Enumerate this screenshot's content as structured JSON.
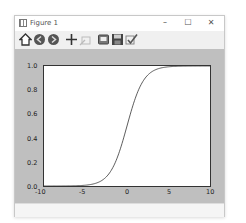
{
  "window": {
    "title": "Figure 1",
    "controls": {
      "minimize": "–",
      "maximize": "☐",
      "close": "✕"
    }
  },
  "toolbar": {
    "buttons": [
      {
        "name": "home",
        "icon": "home-icon"
      },
      {
        "name": "back",
        "icon": "back-arrow-icon"
      },
      {
        "name": "forward",
        "icon": "forward-arrow-icon"
      },
      {
        "name": "pan",
        "icon": "pan-move-icon"
      },
      {
        "name": "zoom",
        "icon": "zoom-rect-icon"
      },
      {
        "name": "configure-subplots",
        "icon": "subplots-icon"
      },
      {
        "name": "save",
        "icon": "save-floppy-icon"
      },
      {
        "name": "edit-axis",
        "icon": "check-edit-icon"
      }
    ]
  },
  "chart_data": {
    "type": "line",
    "title": "",
    "xlabel": "",
    "ylabel": "",
    "xlim": [
      -10,
      10
    ],
    "ylim": [
      0.0,
      1.0
    ],
    "xticks": [
      "-10",
      "-5",
      "0",
      "5",
      "10"
    ],
    "yticks": [
      "0.0",
      "0.2",
      "0.4",
      "0.6",
      "0.8",
      "1.0"
    ],
    "grid": false,
    "legend": null,
    "series": [
      {
        "name": "sigmoid",
        "function": "1/(1+exp(-x))",
        "x": [
          -10,
          -8,
          -6,
          -5,
          -4,
          -3,
          -2,
          -1,
          0,
          1,
          2,
          3,
          4,
          5,
          6,
          8,
          10
        ],
        "y": [
          0.0,
          0.0003,
          0.0025,
          0.0067,
          0.018,
          0.047,
          0.119,
          0.269,
          0.5,
          0.731,
          0.881,
          0.953,
          0.982,
          0.9933,
          0.9975,
          0.9997,
          1.0
        ],
        "color": "#333333"
      }
    ]
  }
}
